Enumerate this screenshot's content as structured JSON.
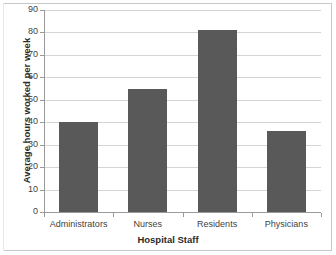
{
  "chart_data": {
    "type": "bar",
    "title": "",
    "xlabel": "Hospital Staff",
    "ylabel": "Average hours worked per week",
    "categories": [
      "Administrators",
      "Nurses",
      "Residents",
      "Physicians"
    ],
    "values": [
      40,
      55,
      81,
      36
    ],
    "ylim": [
      0,
      90
    ],
    "yticks": [
      0,
      10,
      20,
      30,
      40,
      50,
      60,
      70,
      80,
      90
    ],
    "ytick_labels": [
      "0",
      "10",
      "20",
      "30",
      "40",
      "50",
      "60",
      "70",
      "80",
      "90"
    ],
    "grid": true,
    "grid_axis": "y",
    "legend": "none",
    "bar_color": "#595959",
    "gridline_color": "#d4d4d4",
    "axis_color": "#9a9a9a",
    "background_color": "#ffffff",
    "text_color": "#3f3f3f"
  }
}
